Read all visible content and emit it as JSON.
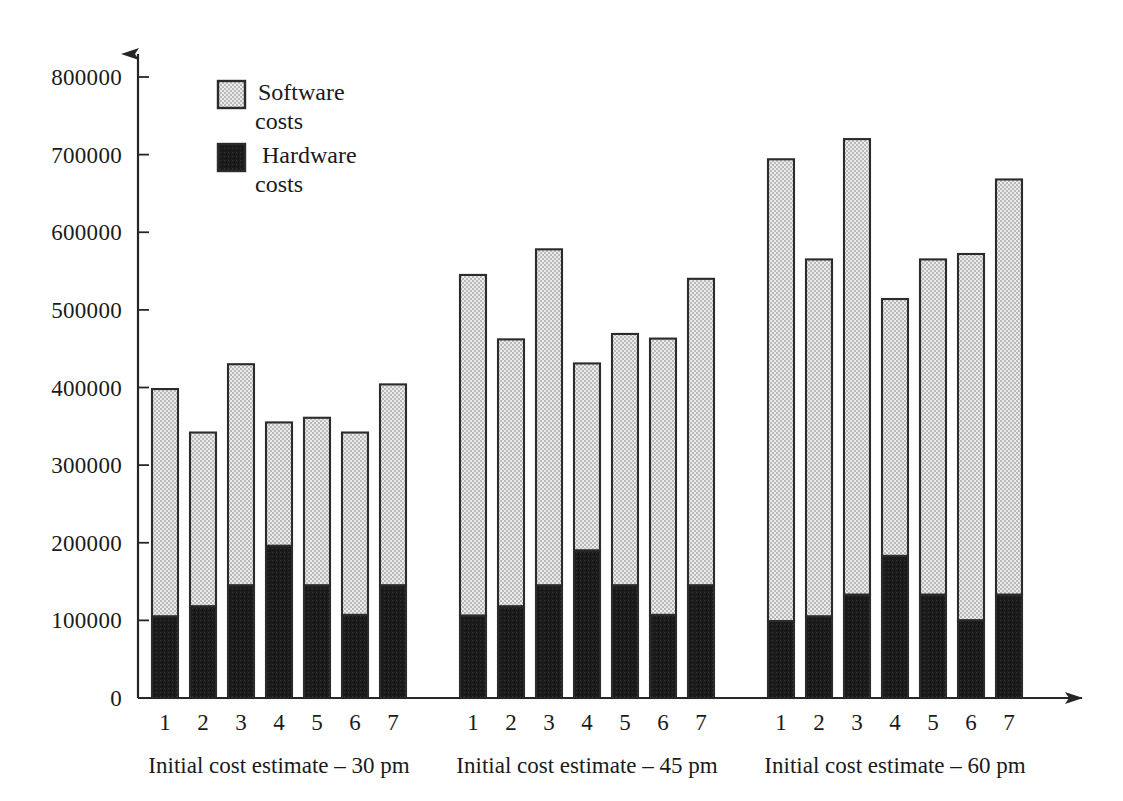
{
  "chart_data": {
    "type": "bar",
    "subtype": "stacked-bar-grouped",
    "title": "",
    "subtitle": "",
    "xlabel": "",
    "ylabel": "",
    "ylim": [
      0,
      800000
    ],
    "ytick_step": 100000,
    "ytick_labels": [
      "800000",
      "700000",
      "600000",
      "500000",
      "400000",
      "300000",
      "200000",
      "100000",
      "0"
    ],
    "ytick_values": [
      800000,
      700000,
      600000,
      500000,
      400000,
      300000,
      200000,
      100000,
      0
    ],
    "grid": false,
    "legend_position": "top-left-inside",
    "legend": [
      {
        "label_line1": "Software",
        "label_line2": "costs",
        "key": "software",
        "color": "#d8d8d8",
        "pattern": "fine-checker-stipple"
      },
      {
        "label_line1": "Hardware",
        "label_line2": "costs",
        "key": "hardware",
        "color": "#1c1c1c",
        "pattern": "solid-dark"
      }
    ],
    "series": [
      {
        "name": "Hardware costs",
        "key": "hardware",
        "color": "#1c1c1c"
      },
      {
        "name": "Software costs",
        "key": "software",
        "color": "#d8d8d8"
      }
    ],
    "categories": [
      "1",
      "2",
      "3",
      "4",
      "5",
      "6",
      "7"
    ],
    "groups": [
      {
        "label": "Initial cost estimate – 30 pm",
        "categories": [
          "1",
          "2",
          "3",
          "4",
          "5",
          "6",
          "7"
        ],
        "hardware": [
          105000,
          118000,
          145000,
          196000,
          145000,
          107000,
          145000
        ],
        "software": [
          293000,
          224000,
          285000,
          159000,
          216000,
          235000,
          259000
        ],
        "totals": [
          398000,
          342000,
          430000,
          355000,
          361000,
          342000,
          404000
        ]
      },
      {
        "label": "Initial cost estimate – 45 pm",
        "categories": [
          "1",
          "2",
          "3",
          "4",
          "5",
          "6",
          "7"
        ],
        "hardware": [
          106000,
          118000,
          145000,
          190000,
          145000,
          107000,
          145000
        ],
        "software": [
          439000,
          344000,
          433000,
          241000,
          324000,
          356000,
          395000
        ],
        "totals": [
          545000,
          462000,
          578000,
          431000,
          469000,
          463000,
          540000
        ]
      },
      {
        "label": "Initial cost estimate – 60 pm",
        "categories": [
          "1",
          "2",
          "3",
          "4",
          "5",
          "6",
          "7"
        ],
        "hardware": [
          99000,
          105000,
          133000,
          183000,
          133000,
          100000,
          133000
        ],
        "software": [
          595000,
          460000,
          587000,
          331000,
          432000,
          472000,
          535000
        ],
        "totals": [
          694000,
          565000,
          720000,
          514000,
          565000,
          572000,
          668000
        ]
      }
    ]
  },
  "axes": {
    "y_arrow": "up-arrow-head",
    "x_arrow": "right-arrow-head",
    "origin_label": "0"
  },
  "colors": {
    "software_fill": "#d8d8d8",
    "hardware_fill": "#1c1c1c",
    "outline": "#2b2b2b",
    "axis": "#262626",
    "text": "#1a1a1a",
    "background": "#ffffff"
  }
}
